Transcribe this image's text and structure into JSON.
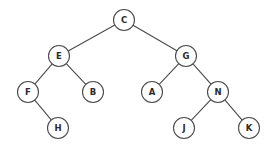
{
  "figure": {
    "width": 275,
    "height": 152,
    "background_color": "#ffffff",
    "stroke_color": "#4a4a4a",
    "label_color": "#2b2b2b",
    "node_fill": "#ffffff",
    "node_radius": 10.5
  },
  "nodes": [
    {
      "id": "C",
      "label": "C",
      "cx": 124,
      "cy": 20
    },
    {
      "id": "E",
      "label": "E",
      "cx": 59,
      "cy": 56
    },
    {
      "id": "G",
      "label": "G",
      "cx": 186,
      "cy": 56
    },
    {
      "id": "F",
      "label": "F",
      "cx": 28,
      "cy": 92
    },
    {
      "id": "B",
      "label": "B",
      "cx": 93,
      "cy": 92
    },
    {
      "id": "A",
      "label": "A",
      "cx": 152,
      "cy": 92
    },
    {
      "id": "N",
      "label": "N",
      "cx": 218,
      "cy": 92
    },
    {
      "id": "H",
      "label": "H",
      "cx": 58,
      "cy": 128
    },
    {
      "id": "J",
      "label": "J",
      "cx": 184,
      "cy": 128
    },
    {
      "id": "K",
      "label": "K",
      "cx": 249,
      "cy": 128
    }
  ],
  "edges": [
    {
      "from": "C",
      "to": "E"
    },
    {
      "from": "C",
      "to": "G"
    },
    {
      "from": "E",
      "to": "F"
    },
    {
      "from": "E",
      "to": "B"
    },
    {
      "from": "G",
      "to": "A"
    },
    {
      "from": "G",
      "to": "N"
    },
    {
      "from": "F",
      "to": "H"
    },
    {
      "from": "N",
      "to": "J"
    },
    {
      "from": "N",
      "to": "K"
    }
  ]
}
